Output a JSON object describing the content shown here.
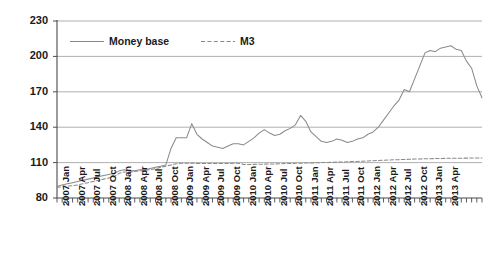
{
  "chart_data": {
    "type": "line",
    "title": "",
    "xlabel": "",
    "ylabel": "",
    "ylim": [
      80,
      230
    ],
    "yticks": [
      80,
      110,
      140,
      170,
      200,
      230
    ],
    "grid": true,
    "legend_position": "top-left-inside",
    "x": [
      "2007 Jan",
      "2007 Feb",
      "2007 Mar",
      "2007 Apr",
      "2007 May",
      "2007 Jun",
      "2007 Jul",
      "2007 Aug",
      "2007 Sep",
      "2007 Oct",
      "2007 Nov",
      "2007 Dec",
      "2008 Jan",
      "2008 Feb",
      "2008 Mar",
      "2008 Apr",
      "2008 May",
      "2008 Jun",
      "2008 Jul",
      "2008 Aug",
      "2008 Sep",
      "2008 Oct",
      "2008 Nov",
      "2008 Dec",
      "2009 Jan",
      "2009 Feb",
      "2009 Mar",
      "2009 Apr",
      "2009 May",
      "2009 Jun",
      "2009 Jul",
      "2009 Aug",
      "2009 Sep",
      "2009 Oct",
      "2009 Nov",
      "2009 Dec",
      "2010 Jan",
      "2010 Feb",
      "2010 Mar",
      "2010 Apr",
      "2010 May",
      "2010 Jun",
      "2010 Jul",
      "2010 Aug",
      "2010 Sep",
      "2010 Oct",
      "2010 Nov",
      "2010 Dec",
      "2011 Jan",
      "2011 Feb",
      "2011 Mar",
      "2011 Apr",
      "2011 May",
      "2011 Jun",
      "2011 Jul",
      "2011 Aug",
      "2011 Sep",
      "2011 Oct",
      "2011 Nov",
      "2011 Dec",
      "2012 Jan",
      "2012 Feb",
      "2012 Mar",
      "2012 Apr",
      "2012 May",
      "2012 Jun",
      "2012 Jul",
      "2012 Aug",
      "2012 Sep",
      "2012 Oct",
      "2012 Nov",
      "2012 Dec",
      "2013 Jan",
      "2013 Feb",
      "2013 Mar",
      "2013 Apr"
    ],
    "xtick_labels": [
      "2007 Jan",
      "2007 Apr",
      "2007 Jul",
      "2007 Oct",
      "2008 Jan",
      "2008 Apr",
      "2008 Jul",
      "2008 Oct",
      "2009 Jan",
      "2009 Apr",
      "2009 Jul",
      "2009 Oct",
      "2010 Jan",
      "2010 Apr",
      "2010 Jul",
      "2010 Oct",
      "2011 Jan",
      "2011 Apr",
      "2011 Jul",
      "2011 Oct",
      "2012 Jan",
      "2012 Apr",
      "2012 Jul",
      "2012 Oct",
      "2013 Jan",
      "2013 Apr"
    ],
    "xtick_indices": [
      0,
      3,
      6,
      9,
      12,
      15,
      18,
      21,
      24,
      27,
      30,
      33,
      36,
      39,
      42,
      45,
      48,
      51,
      54,
      57,
      60,
      63,
      66,
      69,
      72,
      75
    ],
    "series": [
      {
        "name": "Money base",
        "style": "solid",
        "color": "#8a8a8a",
        "values": [
          90,
          91,
          92,
          93,
          94,
          95,
          96,
          97,
          98,
          99,
          100,
          101,
          103,
          104,
          103,
          103,
          104,
          104,
          105,
          106,
          107,
          108,
          122,
          131,
          131,
          131,
          143,
          134,
          130,
          127,
          124,
          123,
          122,
          124,
          126,
          126,
          125,
          128,
          131,
          135,
          138,
          135,
          133,
          134,
          137,
          139,
          142,
          150,
          145,
          136,
          132,
          128,
          127,
          128,
          130,
          129,
          127,
          128,
          130,
          131,
          134,
          136,
          140,
          146,
          152,
          158,
          163,
          172,
          170,
          181,
          192,
          203,
          205,
          204,
          207,
          208
        ]
      },
      {
        "name": "M3",
        "style": "dashed",
        "color": "#8a8a8a",
        "values": [
          89,
          89.5,
          90,
          90.5,
          91,
          92,
          93,
          94,
          95,
          96,
          97,
          98,
          101,
          102,
          102,
          102.5,
          103,
          103.5,
          104,
          105,
          106,
          107,
          108,
          109,
          109.5,
          109.5,
          109.5,
          109.3,
          109.2,
          109.2,
          109.2,
          109.2,
          109.2,
          109.3,
          109.4,
          109.5,
          108.5,
          108.4,
          108.5,
          108.6,
          108.7,
          108.8,
          108.9,
          109,
          109.2,
          109.3,
          109.4,
          109.5,
          109.6,
          109.7,
          109.8,
          110,
          110.1,
          110.2,
          110.4,
          110.5,
          110.7,
          110.9,
          111,
          111.2,
          111.4,
          111.6,
          111.8,
          112,
          112.2,
          112.4,
          112.5,
          112.7,
          112.8,
          113,
          113.1,
          113.2,
          113.3,
          113.4,
          113.5,
          113.6
        ]
      }
    ],
    "money_base_extended": [
      90,
      91,
      92,
      93,
      94,
      95,
      96,
      97,
      98,
      99,
      100,
      101,
      103,
      104,
      103,
      103,
      104,
      104,
      105,
      106,
      107,
      108,
      122,
      131,
      131,
      131,
      143,
      134,
      130,
      127,
      124,
      123,
      122,
      124,
      126,
      126,
      125,
      128,
      131,
      135,
      138,
      135,
      133,
      134,
      137,
      139,
      142,
      150,
      145,
      136,
      132,
      128,
      127,
      128,
      130,
      129,
      127,
      128,
      130,
      131,
      134,
      136,
      140,
      146,
      152,
      158,
      163,
      172,
      170,
      181,
      192,
      203,
      205,
      204,
      207,
      208,
      209,
      206,
      205,
      196,
      190,
      175,
      165
    ]
  },
  "legend": {
    "entries": [
      {
        "label": "Money base",
        "style": "solid"
      },
      {
        "label": "M3",
        "style": "dashed"
      }
    ]
  },
  "colors": {
    "line": "#8a8a8a",
    "grid": "#9a9a9a",
    "axis": "#4a4a4a",
    "text": "#1a1a1a",
    "background": "#ffffff"
  }
}
